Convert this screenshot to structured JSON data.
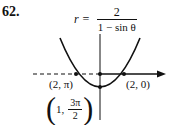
{
  "problem_number": "62.",
  "equation": {
    "lhs": "r =",
    "numerator": "2",
    "denominator": "1 − sin θ"
  },
  "points": [
    {
      "label": "(2, π)",
      "r": "2",
      "theta": "π"
    },
    {
      "label": "(2, 0)",
      "r": "2",
      "theta": "0"
    },
    {
      "label_r": "1,",
      "label_theta_num": "3π",
      "label_theta_den": "2"
    }
  ],
  "curve": {
    "type": "parabola",
    "opening": "up",
    "polar_axis": "dashed left of pole, solid arrow to right"
  }
}
